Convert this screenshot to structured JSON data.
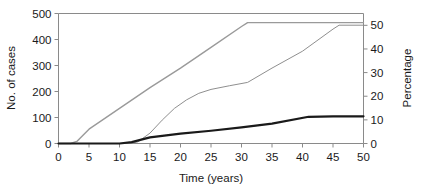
{
  "chart_data": {
    "type": "line",
    "title": "",
    "subtitle": "",
    "xlabel": "Time (years)",
    "ylabel": "No. of cases",
    "y2label": "Percentage",
    "xlim": [
      0,
      50
    ],
    "ylim": [
      0,
      500
    ],
    "y2lim": [
      0,
      55
    ],
    "xticks": [
      0,
      5,
      10,
      15,
      20,
      25,
      30,
      35,
      40,
      45,
      50
    ],
    "xtick_labels": [
      "0",
      "5",
      "10",
      "15",
      "20",
      "25",
      "30",
      "35",
      "40",
      "45",
      "50"
    ],
    "yticks": [
      0,
      100,
      200,
      300,
      400,
      500
    ],
    "ytick_labels": [
      "0",
      "100",
      "200",
      "300",
      "400",
      "500"
    ],
    "y2ticks": [
      0,
      10,
      20,
      30,
      40,
      50
    ],
    "y2tick_labels": [
      "0",
      "10",
      "20",
      "30",
      "40",
      "50"
    ],
    "grid": false,
    "legend": "none",
    "series": [
      {
        "name": "upper-cumulative-cases",
        "axis": "left",
        "color": "#9a9a9a",
        "width": 1.4,
        "x": [
          0,
          2,
          3,
          5,
          10,
          15,
          20,
          25,
          30,
          31,
          35,
          40,
          45,
          50
        ],
        "values": [
          0,
          0,
          8,
          55,
          135,
          215,
          290,
          370,
          450,
          465,
          465,
          465,
          465,
          465
        ]
      },
      {
        "name": "middle-cumulative-cases",
        "axis": "left",
        "color": "#8f8f8f",
        "width": 1.0,
        "x": [
          0,
          10,
          12,
          13,
          15,
          17,
          19,
          21,
          23,
          25,
          28,
          31,
          35,
          40,
          45,
          46,
          50
        ],
        "values": [
          0,
          0,
          2,
          6,
          40,
          90,
          135,
          168,
          193,
          208,
          222,
          235,
          290,
          355,
          440,
          455,
          455
        ]
      },
      {
        "name": "lower-percentage-curve",
        "axis": "right",
        "color": "#1a1a1a",
        "width": 2.2,
        "x": [
          0,
          10,
          12,
          15,
          20,
          25,
          30,
          35,
          41,
          45,
          50
        ],
        "values": [
          0,
          0,
          0.6,
          2.6,
          4.2,
          5.4,
          6.8,
          8.4,
          11.3,
          11.5,
          11.5
        ]
      }
    ]
  },
  "axes": {
    "x_title": "Time (years)",
    "y_left_title": "No. of cases",
    "y_right_title": "Percentage"
  }
}
